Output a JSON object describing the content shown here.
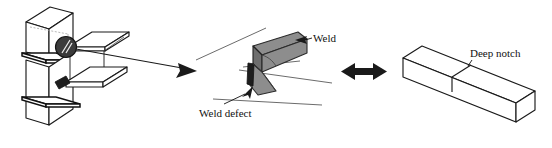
{
  "figure": {
    "background_color": "#ffffff",
    "line_color": "#1a1a1a",
    "weld_fill_color": "#8d8d8d",
    "defect_color": "#1d1d1d",
    "marker_color": "#3b3b3b"
  },
  "panels": {
    "left": {
      "name": "beam-column-connection",
      "description": "Three-dimensional beam-to-column welded moment connection",
      "detail_marker": "weld-joint-highlight"
    },
    "middle": {
      "name": "weld-detail",
      "description": "Magnified view of weld bead and weld root defect"
    },
    "right": {
      "name": "notched-beam-specimen",
      "description": "Prismatic beam specimen containing a deep notch"
    }
  },
  "labels": {
    "weld": "Weld",
    "weld_defect": "Weld defect",
    "deep_notch": "Deep notch"
  },
  "arrows": {
    "detail_arrow": "detail-callout-arrow",
    "equivalence_arrow": "equivalence-double-arrow",
    "equivalence_glyph": "↔"
  }
}
